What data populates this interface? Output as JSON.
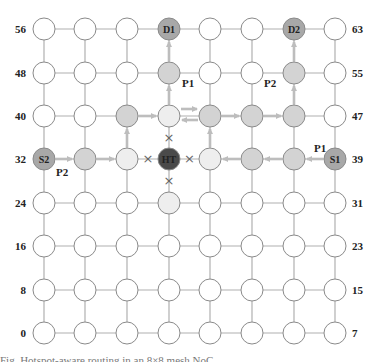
{
  "diagram": {
    "grid": {
      "cols": 8,
      "rows": 8,
      "col_x": [
        44,
        85,
        127,
        169,
        210,
        252,
        294,
        335
      ],
      "row_y": [
        333,
        290,
        246,
        203,
        159,
        116,
        73,
        29
      ],
      "node_radius": 11
    },
    "row_labels_left": [
      "0",
      "8",
      "16",
      "24",
      "32",
      "40",
      "48",
      "56"
    ],
    "row_labels_right": [
      "7",
      "15",
      "23",
      "31",
      "39",
      "47",
      "55",
      "63"
    ],
    "colors": {
      "default": "#ffffff",
      "path": "#d3d3d3",
      "affected": "#eeeeee",
      "endpoint": "#a8a8a8",
      "hotspot": "#4a4a4a",
      "edge": "#b0b0b0",
      "arrow": "#bdbdbd",
      "stroke": "#8a8a8a"
    },
    "special_nodes": [
      {
        "id": 59,
        "label": "D1",
        "type": "endpoint"
      },
      {
        "id": 62,
        "label": "D2",
        "type": "endpoint"
      },
      {
        "id": 32,
        "label": "S2",
        "type": "endpoint"
      },
      {
        "id": 39,
        "label": "S1",
        "type": "endpoint"
      },
      {
        "id": 35,
        "label": "HT",
        "type": "hotspot"
      },
      {
        "id": 51,
        "label": "",
        "type": "path"
      },
      {
        "id": 54,
        "label": "",
        "type": "path"
      },
      {
        "id": 42,
        "label": "",
        "type": "path"
      },
      {
        "id": 44,
        "label": "",
        "type": "path"
      },
      {
        "id": 45,
        "label": "",
        "type": "path"
      },
      {
        "id": 46,
        "label": "",
        "type": "path"
      },
      {
        "id": 33,
        "label": "",
        "type": "path"
      },
      {
        "id": 37,
        "label": "",
        "type": "path"
      },
      {
        "id": 38,
        "label": "",
        "type": "path"
      },
      {
        "id": 43,
        "label": "",
        "type": "affected"
      },
      {
        "id": 34,
        "label": "",
        "type": "affected"
      },
      {
        "id": 36,
        "label": "",
        "type": "affected"
      },
      {
        "id": 27,
        "label": "",
        "type": "affected"
      }
    ],
    "paths": [
      {
        "name": "P1",
        "route": [
          39,
          38,
          37,
          36,
          44,
          43,
          51,
          59
        ]
      },
      {
        "name": "P2",
        "route": [
          32,
          33,
          34,
          42,
          43,
          44,
          45,
          46,
          54,
          62
        ]
      }
    ],
    "path_labels": [
      {
        "text": "P1",
        "x": 182,
        "y": 87
      },
      {
        "text": "P2",
        "x": 264,
        "y": 87
      },
      {
        "text": "P1",
        "x": 314,
        "y": 152
      },
      {
        "text": "P2",
        "x": 56,
        "y": 176
      }
    ],
    "blocked_links_marker": "×",
    "blocked_links": [
      [
        35,
        43
      ],
      [
        35,
        27
      ],
      [
        35,
        34
      ],
      [
        35,
        36
      ]
    ]
  },
  "caption": {
    "text": "Fig. Hotspot-aware routing in an 8×8 mesh NoC"
  }
}
